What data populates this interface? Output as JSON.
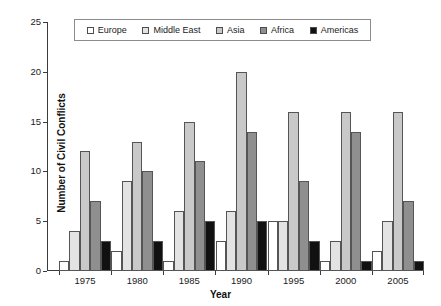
{
  "chart_data": {
    "type": "bar",
    "title": "",
    "xlabel": "Year",
    "ylabel": "Number of Civil Conflicts",
    "categories": [
      "1975",
      "1980",
      "1985",
      "1990",
      "1995",
      "2000",
      "2005"
    ],
    "ylim": [
      0,
      25
    ],
    "yticks": [
      0,
      5,
      10,
      15,
      20,
      25
    ],
    "grid": false,
    "legend_position": "top-center",
    "series": [
      {
        "name": "Europe",
        "color": "#ffffff",
        "values": [
          1,
          2,
          1,
          3,
          5,
          1,
          2
        ]
      },
      {
        "name": "Middle East",
        "color": "#e3e3e3",
        "values": [
          4,
          9,
          6,
          6,
          5,
          3,
          5
        ]
      },
      {
        "name": "Asia",
        "color": "#c9c9c9",
        "values": [
          12,
          13,
          15,
          20,
          16,
          16,
          16
        ]
      },
      {
        "name": "Africa",
        "color": "#8f8f8f",
        "values": [
          7,
          10,
          11,
          14,
          9,
          14,
          7
        ]
      },
      {
        "name": "Americas",
        "color": "#111111",
        "values": [
          3,
          3,
          5,
          5,
          3,
          1,
          1
        ]
      }
    ]
  },
  "axis": {
    "edge_color": "#3b3b3b",
    "bar_edge_color": "#555555"
  }
}
